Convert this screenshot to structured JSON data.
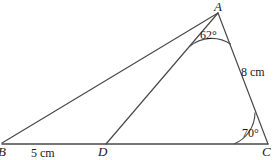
{
  "figure": {
    "type": "geometry-diagram",
    "stroke_color": "#3a3a3a",
    "text_color": "#1a1a1a",
    "background_color": "#ffffff",
    "width": 277,
    "height": 160,
    "vertices": {
      "A": {
        "label": "A",
        "x": 218,
        "y": 12
      },
      "B": {
        "label": "B",
        "x": 2,
        "y": 144
      },
      "C": {
        "label": "C",
        "x": 268,
        "y": 144
      },
      "D": {
        "label": "D",
        "x": 106,
        "y": 144
      }
    },
    "angles": {
      "DAC": {
        "label": "62°",
        "value": 62,
        "unit": "degrees",
        "at": "A"
      },
      "ACB": {
        "label": "70°",
        "value": 70,
        "unit": "degrees",
        "at": "C"
      }
    },
    "lengths": {
      "BD": {
        "label": "5 cm",
        "value": 5,
        "unit": "cm",
        "segment": "B to D"
      },
      "AC": {
        "label": "8 cm",
        "value": 8,
        "unit": "cm",
        "segment": "A to C"
      }
    },
    "segments": [
      {
        "name": "BC",
        "from": "B",
        "to": "C"
      },
      {
        "name": "AB",
        "from": "A",
        "to": "B"
      },
      {
        "name": "AC",
        "from": "A",
        "to": "C"
      },
      {
        "name": "AD",
        "from": "A",
        "to": "D"
      }
    ]
  }
}
